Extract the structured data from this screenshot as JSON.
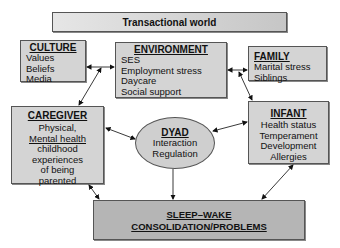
{
  "title": "Transactional world",
  "culture": {
    "heading": "CULTURE",
    "items": [
      "Values",
      "Beliefs",
      "Media"
    ]
  },
  "environment": {
    "heading": "ENVIRONMENT",
    "items": [
      "SES",
      "Employment stress",
      "Daycare",
      "Social support"
    ]
  },
  "family": {
    "heading": "FAMILY",
    "items": [
      "Marital stress",
      "Siblings"
    ]
  },
  "caregiver": {
    "heading": "CAREGIVER",
    "items": [
      "Physical,",
      "Mental health",
      "childhood",
      "experiences",
      "of being",
      "parented"
    ]
  },
  "dyad": {
    "heading": "DYAD",
    "items": [
      "Interaction",
      "Regulation"
    ]
  },
  "infant": {
    "heading": "INFANT",
    "items": [
      "Health status",
      "Temperament",
      "Development",
      "Allergies"
    ]
  },
  "outcome": {
    "line1": "SLEEP–WAKE",
    "line2": "CONSOLIDATION/PROBLEMS"
  },
  "colors": {
    "box_fill": "#d4d4d4",
    "outcome_fill": "#b5b5b5",
    "border": "#555555"
  }
}
